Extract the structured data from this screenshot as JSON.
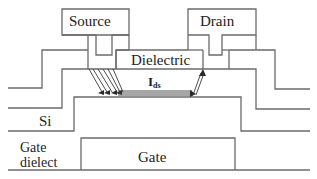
{
  "diagram": {
    "type": "cross-section",
    "labels": {
      "source": "Source",
      "drain": "Drain",
      "dielectric": "Dielectric",
      "current_main": "I",
      "current_sub": "ds",
      "si": "Si",
      "gate_dielect_line1": "Gate",
      "gate_dielect_line2": "dielect",
      "gate": "Gate"
    },
    "colors": {
      "line": "#6b6b6b",
      "arrow": "#3a3a3a",
      "text": "#222222",
      "background": "#ffffff"
    }
  }
}
